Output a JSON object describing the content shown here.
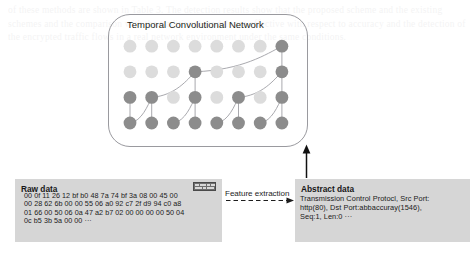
{
  "figure": {
    "watermark_text": "of these methods are shown in Table 3. The detection results show that the proposed scheme and the existing schemes and the comparison with the traditional models are effective with respect to accuracy and the detection of the encrypted traffic flows in a real network environment under the same conditions."
  },
  "tcn": {
    "title": "Temporal Convolutional Network",
    "rows": 4,
    "cols": 8,
    "active_color": "#8c8c8c",
    "inactive_color": "#dcdcdc",
    "edge_color": "#9a9a9f",
    "active_nodes": [
      [
        0,
        1,
        2,
        3,
        4,
        5,
        6,
        7
      ],
      [
        0,
        1,
        3,
        5,
        7
      ],
      [
        3,
        7
      ],
      [
        7
      ]
    ]
  },
  "raw_data": {
    "title": "Raw data",
    "lines": [
      "00 0f 11 26 12 bf b0 48 7a 74 bf 3a 08 00 45 00",
      "00 28 62 6b 00 00 55 06 a0 92 c7 2f d9 94 c0 a8",
      "01 66 00 50 06 0a 47 a2 b7 02 00 00 00 00 50 04",
      "0c b5 3b 5a 00 00 ···"
    ],
    "thumbnail_name": "packet-capture-thumbnail"
  },
  "abstract_data": {
    "title": "Abstract data",
    "lines": [
      "Transmission Control Protocl, Src Port:",
      "http(80), Dst Port:abbaccuray(1546),",
      "Seq:1, Len:0 ···"
    ]
  },
  "arrows": {
    "feature_extraction_label": "Feature extraction",
    "feature_extraction_style": "dashed",
    "abstract_to_tcn_style": "solid"
  },
  "colors": {
    "panel_background": "#d6d6d6",
    "outline": "#9a9a9f",
    "text": "#1a1a1a"
  }
}
